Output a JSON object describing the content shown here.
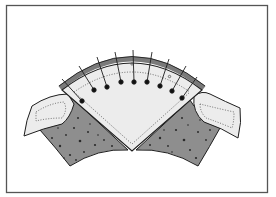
{
  "figure": {
    "colors": {
      "background": "#ffffff",
      "frame": "#555555",
      "light_fabric": "#ececec",
      "printed_fabric": "#8e8e8e",
      "print_dots": "#2a2a2a",
      "outline": "#1e1e1e",
      "seam_band": "#7a7a7a",
      "stitch_line": "#4a4a4a"
    },
    "pins": [
      {
        "head": [
          82,
          101
        ],
        "tip": [
          62,
          79
        ]
      },
      {
        "head": [
          94,
          90
        ],
        "tip": [
          79,
          66
        ]
      },
      {
        "head": [
          107,
          87
        ],
        "tip": [
          97,
          57
        ]
      },
      {
        "head": [
          121,
          82
        ],
        "tip": [
          115,
          52
        ]
      },
      {
        "head": [
          134,
          82
        ],
        "tip": [
          133,
          50
        ]
      },
      {
        "head": [
          147,
          82
        ],
        "tip": [
          152,
          52
        ]
      },
      {
        "head": [
          160,
          86
        ],
        "tip": [
          169,
          59
        ]
      },
      {
        "head": [
          172,
          91
        ],
        "tip": [
          186,
          66
        ]
      },
      {
        "head": [
          182,
          98
        ],
        "tip": [
          197,
          77
        ]
      }
    ]
  }
}
